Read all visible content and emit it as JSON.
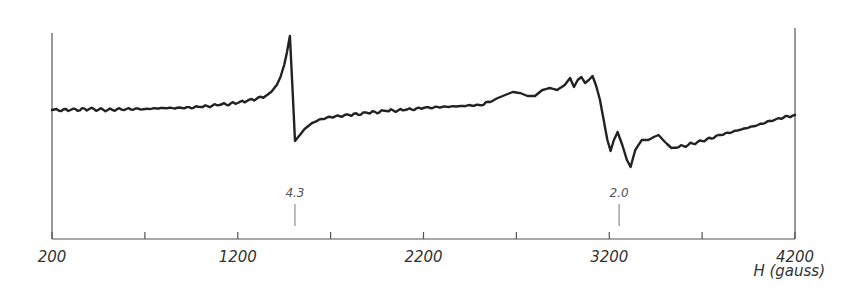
{
  "chart_data": {
    "type": "line",
    "title": "",
    "xlabel": "H (gauss)",
    "ylabel": "",
    "xlim": [
      200,
      4200
    ],
    "ylim": [
      -90,
      90
    ],
    "x_tick_labels": [
      {
        "value": 200,
        "label": "200"
      },
      {
        "value": 1200,
        "label": "1200"
      },
      {
        "value": 2200,
        "label": "2200"
      },
      {
        "value": 3200,
        "label": "3200"
      },
      {
        "value": 4200,
        "label": "4200"
      }
    ],
    "x_minor_ticks": [
      700,
      1700,
      2700,
      3700
    ],
    "grid": false,
    "legend": null,
    "annotations": [
      {
        "label": "4.3",
        "x": 1508
      },
      {
        "label": "2.0",
        "x": 3253
      }
    ],
    "series": [
      {
        "name": "EPR derivative signal (arb. units)",
        "x": [
          200,
          300,
          400,
          500,
          600,
          700,
          800,
          900,
          1000,
          1100,
          1200,
          1250,
          1300,
          1350,
          1380,
          1410,
          1430,
          1450,
          1465,
          1481,
          1508,
          1530,
          1560,
          1600,
          1650,
          1700,
          1800,
          1900,
          2000,
          2100,
          2200,
          2300,
          2400,
          2500,
          2560,
          2600,
          2640,
          2680,
          2720,
          2760,
          2800,
          2840,
          2880,
          2920,
          2960,
          2989,
          3010,
          3030,
          3050,
          3070,
          3090,
          3110,
          3130,
          3150,
          3170,
          3190,
          3207,
          3225,
          3245,
          3270,
          3295,
          3315,
          3340,
          3375,
          3410,
          3440,
          3465,
          3500,
          3535,
          3600,
          3700,
          3800,
          3900,
          4000,
          4100,
          4200
        ],
        "y": [
          0,
          0,
          1,
          0,
          1,
          1,
          2,
          2,
          3,
          5,
          7,
          9,
          11,
          14,
          18,
          25,
          33,
          45,
          58,
          74,
          -31,
          -26,
          -19,
          -13,
          -9,
          -7,
          -5,
          -3,
          -1,
          0,
          2,
          3,
          4,
          5,
          8,
          12,
          15,
          18,
          17,
          14,
          14,
          20,
          22,
          20,
          25,
          32,
          23,
          30,
          33,
          27,
          30,
          34,
          24,
          10,
          -10,
          -30,
          -41,
          -30,
          -22,
          -35,
          -50,
          -57,
          -40,
          -30,
          -30,
          -27,
          -25,
          -32,
          -38,
          -36,
          -31,
          -25,
          -20,
          -15,
          -9,
          -5
        ]
      }
    ]
  }
}
